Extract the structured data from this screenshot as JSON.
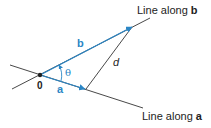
{
  "labels": {
    "line_b": {
      "prefix": "Line along ",
      "vector": "b"
    },
    "line_a": {
      "prefix": "Line along ",
      "vector": "a"
    },
    "vector_b": "b",
    "vector_a": "a",
    "angle": "θ",
    "distance": "d",
    "origin": "0"
  },
  "colors": {
    "vector": "#2b86c5",
    "line": "#333333",
    "background": "#ffffff"
  }
}
